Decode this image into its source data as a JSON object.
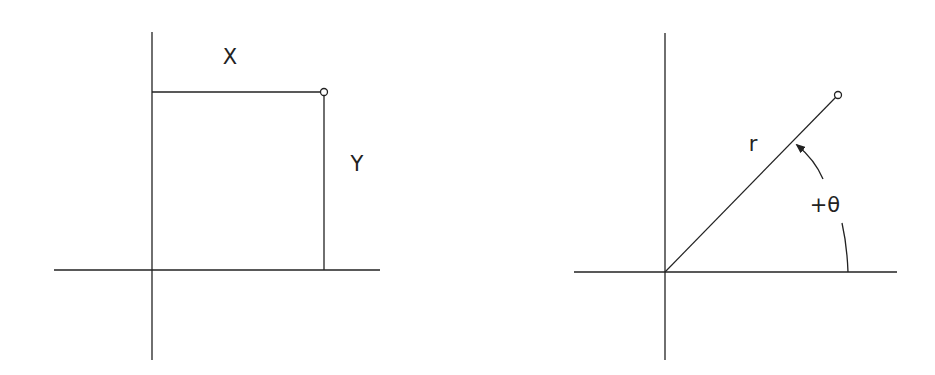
{
  "diagram": {
    "type": "coordinate-systems",
    "panels": [
      {
        "name": "cartesian",
        "labels": {
          "x": "X",
          "y": "Y"
        },
        "axes": {
          "horizontal": {
            "x1": 54,
            "x2": 380,
            "y": 270
          },
          "vertical": {
            "x": 152,
            "y1": 32,
            "y2": 360
          }
        },
        "point": {
          "x": 324,
          "y": 92
        }
      },
      {
        "name": "polar",
        "labels": {
          "r": "r",
          "theta": "+θ"
        },
        "axes": {
          "horizontal": {
            "x1": 574,
            "x2": 897,
            "y": 272
          },
          "vertical": {
            "x": 665,
            "y1": 33,
            "y2": 360
          }
        },
        "origin": {
          "x": 665,
          "y": 272
        },
        "point": {
          "x": 838,
          "y": 95
        }
      }
    ],
    "colors": {
      "line": "#222222",
      "background": "#ffffff"
    }
  }
}
